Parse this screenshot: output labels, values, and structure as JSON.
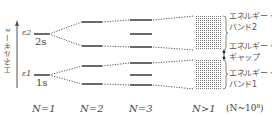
{
  "diagram": {
    "axis": {
      "label": "エネルギー ε"
    },
    "levels_n1": [
      {
        "symbol": "ε2",
        "orbital": "2s"
      },
      {
        "symbol": "ε1",
        "orbital": "1s"
      }
    ],
    "columns": [
      {
        "label": "N=1"
      },
      {
        "label": "N=2"
      },
      {
        "label": "N=3"
      },
      {
        "label": "N>1",
        "note": "(N~10⁸)"
      }
    ],
    "band_labels": [
      {
        "line1": "エネルギー・",
        "line2": "バンド2"
      },
      {
        "line1": "エネルギー・",
        "line2": "ギャップ"
      },
      {
        "line1": "エネルギー・",
        "line2": "バンド1"
      }
    ],
    "colors": {
      "line": "#444444",
      "dots": "#666666",
      "band": "#777777"
    }
  }
}
